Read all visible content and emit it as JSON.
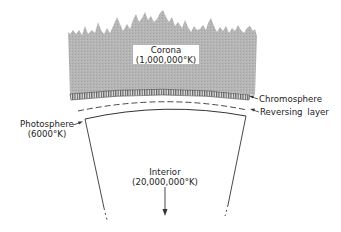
{
  "diagram": {
    "type": "sun-structure-cross-section",
    "layers": [
      {
        "name": "Corona",
        "temperature": "(1,000,000°K)"
      },
      {
        "name": "Chromosphere"
      },
      {
        "name": "Reversing layer"
      },
      {
        "name": "Photosphere",
        "temperature": "(6000°K)"
      },
      {
        "name": "Interior",
        "temperature": "(20,000,000°K)"
      }
    ],
    "colors": {
      "corona_fill": "#b3b3b3",
      "line": "#333333",
      "background": "#ffffff"
    }
  }
}
